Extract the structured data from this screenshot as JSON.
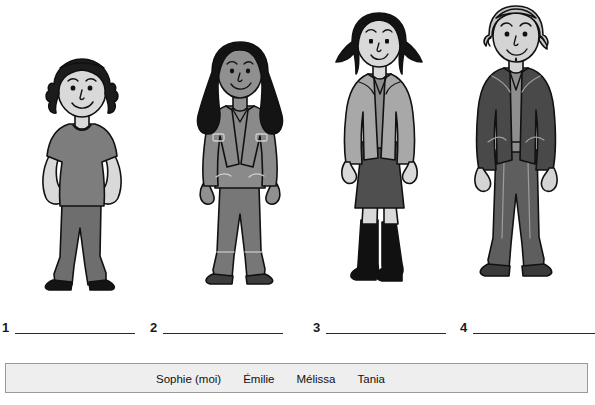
{
  "worksheet": {
    "type": "matching-exercise",
    "language": "fr"
  },
  "figures": [
    {
      "id": "figure-1",
      "position": 1,
      "description": "femme aux cheveux noirs bouclés courts, t-shirt gris, pantalon gris foncé, mains sur les hanches",
      "hair": "short curly black",
      "hair_color": "#1c1c1c",
      "skin_color": "#d9d9d9",
      "top_color": "#7d7d7d",
      "bottom_color": "#6e6e6e",
      "shoe_color": "#141414"
    },
    {
      "id": "figure-2",
      "position": 2,
      "description": "femme aux longs cheveux noirs, peau foncée, veste en jean grise, jeans",
      "hair": "long black",
      "hair_color": "#141414",
      "skin_color": "#909090",
      "top_color": "#8a8a8a",
      "bottom_color": "#777777",
      "shoe_color": "#3d3d3d"
    },
    {
      "id": "figure-3",
      "position": 3,
      "description": "femme aux cheveux noirs mi-longs, veste gris clair, jupe gris foncé, bottes noires",
      "hair": "shoulder-length black bob",
      "hair_color": "#141414",
      "skin_color": "#d9d9d9",
      "top_color": "#a8a8a8",
      "bottom_color": "#4f4f4f",
      "shoe_color": "#111111"
    },
    {
      "id": "figure-4",
      "position": 4,
      "description": "femme âgée aux cheveux gris clair courts, veston gris foncé, haut gris, pantalon gris foncé",
      "hair": "short light gray",
      "hair_color": "#c6c6c6",
      "skin_color": "#d4d4d4",
      "top_color": "#494949",
      "bottom_color": "#5e5e5e",
      "shoe_color": "#3a3a3a"
    }
  ],
  "answers": [
    {
      "number": "1",
      "value": "",
      "line_x": 13,
      "line_width": 120
    },
    {
      "number": "2",
      "value": "",
      "line_x": 161,
      "line_width": 120
    },
    {
      "number": "3",
      "value": "",
      "line_x": 324,
      "line_width": 120
    },
    {
      "number": "4",
      "value": "",
      "line_x": 471,
      "line_width": 120
    }
  ],
  "word_bank": {
    "words": [
      "Sophie (moi)",
      "Émilie",
      "Mélissa",
      "Tania"
    ],
    "background_color": "#eeeeee",
    "border_color": "#9a9a9a"
  }
}
